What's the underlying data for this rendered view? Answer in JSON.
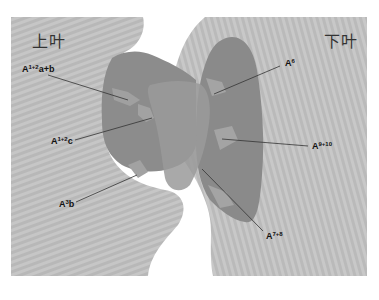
{
  "figure": {
    "type": "lung-lobe-artery-diagram",
    "lobes": {
      "upper": "上叶",
      "lower": "下叶"
    },
    "labels": [
      {
        "id": "a12ab",
        "base": "A",
        "sup": "1+2",
        "suffix": "a+b"
      },
      {
        "id": "a12c",
        "base": "A",
        "sup": "1+2",
        "suffix": "c"
      },
      {
        "id": "a3b",
        "base": "A",
        "sup": "3",
        "suffix": "b"
      },
      {
        "id": "a6",
        "base": "A",
        "sup": "6",
        "suffix": ""
      },
      {
        "id": "a910",
        "base": "A",
        "sup": "9+10",
        "suffix": ""
      },
      {
        "id": "a78",
        "base": "A",
        "sup": "7+8",
        "suffix": ""
      }
    ],
    "colors": {
      "lobe_fill": "#c4c4c4",
      "lobe_stripe": "#b4b4b4",
      "artery_fill": "#8a8a8a",
      "artery_dark": "#7a7a7a",
      "leader_line": "#333333",
      "background": "#ffffff"
    }
  }
}
